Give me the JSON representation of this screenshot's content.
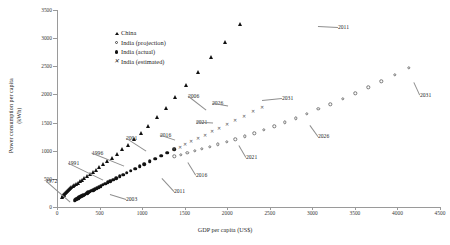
{
  "chart_data": {
    "type": "scatter",
    "title": "",
    "xlabel": "GDP per capita (US$)",
    "ylabel": "Power consumption per capita (kWh)",
    "xlim": [
      0,
      4500
    ],
    "ylim": [
      0,
      3500
    ],
    "xticks": [
      0,
      500,
      1000,
      1500,
      2000,
      2500,
      3000,
      3500,
      4000,
      4500
    ],
    "yticks": [
      0,
      500,
      1000,
      1500,
      2000,
      2500,
      3000,
      3500
    ],
    "grid": false,
    "legend_position": "upper-left-inset",
    "series": [
      {
        "name": "China",
        "marker": "filled-triangle",
        "color": "#111111",
        "points": [
          [
            60,
            180
          ],
          [
            66,
            195
          ],
          [
            72,
            208
          ],
          [
            78,
            222
          ],
          [
            86,
            238
          ],
          [
            95,
            252
          ],
          [
            104,
            268
          ],
          [
            114,
            282
          ],
          [
            126,
            296
          ],
          [
            138,
            312
          ],
          [
            152,
            330
          ],
          [
            167,
            348
          ],
          [
            184,
            366
          ],
          [
            202,
            386
          ],
          [
            222,
            408
          ],
          [
            244,
            432
          ],
          [
            268,
            458
          ],
          [
            294,
            486
          ],
          [
            322,
            516
          ],
          [
            352,
            548
          ],
          [
            385,
            584
          ],
          [
            420,
            622
          ],
          [
            458,
            664
          ],
          [
            499,
            710
          ],
          [
            544,
            760
          ],
          [
            592,
            816
          ],
          [
            645,
            878
          ],
          [
            702,
            946
          ],
          [
            764,
            1022
          ],
          [
            832,
            1108
          ],
          [
            906,
            1206
          ],
          [
            986,
            1318
          ],
          [
            1074,
            1446
          ],
          [
            1170,
            1592
          ],
          [
            1275,
            1760
          ],
          [
            1390,
            1950
          ],
          [
            1516,
            2165
          ],
          [
            1654,
            2400
          ],
          [
            1805,
            2660
          ],
          [
            1970,
            2940
          ],
          [
            2150,
            3250
          ]
        ]
      },
      {
        "name": "India (actual)",
        "marker": "filled-circle",
        "color": "#111111",
        "points": [
          [
            210,
            120
          ],
          [
            218,
            128
          ],
          [
            226,
            136
          ],
          [
            235,
            144
          ],
          [
            244,
            152
          ],
          [
            254,
            161
          ],
          [
            264,
            170
          ],
          [
            275,
            180
          ],
          [
            286,
            190
          ],
          [
            298,
            200
          ],
          [
            311,
            211
          ],
          [
            324,
            222
          ],
          [
            338,
            234
          ],
          [
            353,
            246
          ],
          [
            369,
            259
          ],
          [
            386,
            273
          ],
          [
            404,
            288
          ],
          [
            423,
            303
          ],
          [
            443,
            319
          ],
          [
            465,
            336
          ],
          [
            488,
            354
          ],
          [
            512,
            373
          ],
          [
            538,
            393
          ],
          [
            566,
            414
          ],
          [
            596,
            437
          ],
          [
            628,
            461
          ],
          [
            662,
            487
          ],
          [
            698,
            514
          ],
          [
            736,
            543
          ],
          [
            777,
            574
          ],
          [
            821,
            607
          ],
          [
            868,
            642
          ],
          [
            918,
            680
          ],
          [
            971,
            720
          ],
          [
            1028,
            763
          ],
          [
            1089,
            809
          ],
          [
            1154,
            858
          ],
          [
            1223,
            910
          ],
          [
            1297,
            966
          ],
          [
            1376,
            1026
          ]
        ]
      },
      {
        "name": "India (estimated)",
        "marker": "x",
        "color": "#555555",
        "points": [
          [
            1376,
            1026
          ],
          [
            1440,
            1072
          ],
          [
            1508,
            1120
          ],
          [
            1580,
            1172
          ],
          [
            1656,
            1226
          ],
          [
            1736,
            1284
          ],
          [
            1820,
            1344
          ],
          [
            1908,
            1408
          ],
          [
            2000,
            1476
          ],
          [
            2096,
            1546
          ],
          [
            2196,
            1620
          ],
          [
            2300,
            1698
          ],
          [
            2408,
            1780
          ]
        ]
      },
      {
        "name": "India (projection)",
        "marker": "open-circle",
        "color": "#777777",
        "points": [
          [
            1376,
            900
          ],
          [
            1452,
            930
          ],
          [
            1532,
            962
          ],
          [
            1616,
            996
          ],
          [
            1704,
            1032
          ],
          [
            1796,
            1070
          ],
          [
            1892,
            1112
          ],
          [
            1992,
            1156
          ],
          [
            2096,
            1204
          ],
          [
            2204,
            1256
          ],
          [
            2316,
            1312
          ],
          [
            2432,
            1372
          ],
          [
            2552,
            1436
          ],
          [
            2676,
            1504
          ],
          [
            2804,
            1578
          ],
          [
            2936,
            1656
          ],
          [
            3072,
            1740
          ],
          [
            3212,
            1828
          ],
          [
            3356,
            1922
          ],
          [
            3504,
            2020
          ],
          [
            3656,
            2124
          ],
          [
            3812,
            2234
          ],
          [
            3972,
            2348
          ],
          [
            4136,
            2468
          ]
        ]
      }
    ],
    "annotations": [
      {
        "text": "1972",
        "series": "India (actual)",
        "x": 60,
        "y": 560
      },
      {
        "text": "1991",
        "series": "China",
        "x": 480,
        "y": 1010
      },
      {
        "text": "1996",
        "series": "China",
        "x": 790,
        "y": 1290
      },
      {
        "text": "2001",
        "series": "China",
        "x": 1070,
        "y": 1390
      },
      {
        "text": "2006",
        "series": "China",
        "x": 1790,
        "y": 2320
      },
      {
        "text": "2011",
        "series": "China",
        "x": 2620,
        "y": 3255
      },
      {
        "text": "2003",
        "series": "India (actual)",
        "x": 820,
        "y": 300
      },
      {
        "text": "2011",
        "series": "India (actual)",
        "x": 1390,
        "y": 470
      },
      {
        "text": "2016",
        "series": "India (estimated)",
        "x": 1330,
        "y": 1190
      },
      {
        "text": "2021",
        "series": "India (estimated)",
        "x": 1790,
        "y": 1500
      },
      {
        "text": "2026",
        "series": "India (estimated)",
        "x": 2020,
        "y": 1810
      },
      {
        "text": "2031",
        "series": "India (estimated)",
        "x": 2760,
        "y": 2030
      },
      {
        "text": "2016",
        "series": "India (projection)",
        "x": 1560,
        "y": 790
      },
      {
        "text": "2021",
        "series": "India (projection)",
        "x": 2180,
        "y": 1080
      },
      {
        "text": "2026",
        "series": "India (projection)",
        "x": 3000,
        "y": 1430
      },
      {
        "text": "2031",
        "series": "India (projection)",
        "x": 4240,
        "y": 2190
      }
    ]
  },
  "legend": {
    "items": [
      {
        "label": "China",
        "marker": "filled-triangle"
      },
      {
        "label": "India (projection)",
        "marker": "open-circle"
      },
      {
        "label": "India (actual)",
        "marker": "filled-circle"
      },
      {
        "label": "India (estimated)",
        "marker": "x"
      }
    ]
  },
  "axis": {
    "x_title": "GDP per capita (US$)",
    "y_title_line1": "Power consumption per capita",
    "y_title_line2": "(kWh)"
  }
}
